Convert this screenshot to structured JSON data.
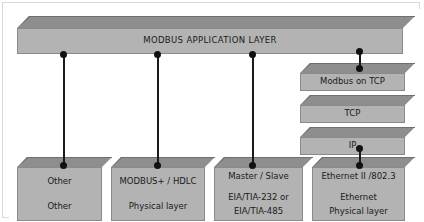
{
  "diagram": {
    "colors": {
      "block_top": "#8e8e8e",
      "block_front": "#b3b3b3",
      "block_top_border": "#6f6f6f",
      "block_front_border": "#8a8a8a",
      "connector": "#1a1a1a",
      "frame_border": "#d8d8d8",
      "background": "#ffffff",
      "text": "#1a1a1a"
    },
    "application_layer": {
      "label": "MODBUS APPLICATION LAYER"
    },
    "tcp_stack": [
      {
        "label": "Modbus on TCP"
      },
      {
        "label": "TCP"
      },
      {
        "label": "IP"
      }
    ],
    "base_layers": [
      {
        "name": "other",
        "line1": "Other",
        "line2": "Other",
        "line3": ""
      },
      {
        "name": "modbus-plus-hdlc",
        "line1": "MODBUS+ / HDLC",
        "line2": "Physical layer",
        "line3": ""
      },
      {
        "name": "serial",
        "line1": "Master / Slave",
        "line2": "EIA/TIA-232 or",
        "line3": "EIA/TIA-485"
      },
      {
        "name": "ethernet",
        "line1": "Ethernet II /802.3",
        "line2": "Ethernet",
        "line3": "Physical layer"
      }
    ],
    "connectors": [
      {
        "name": "app-to-other"
      },
      {
        "name": "app-to-modbus-plus"
      },
      {
        "name": "app-to-serial"
      },
      {
        "name": "app-to-modbus-on-tcp"
      },
      {
        "name": "ip-to-ethernet"
      }
    ]
  }
}
